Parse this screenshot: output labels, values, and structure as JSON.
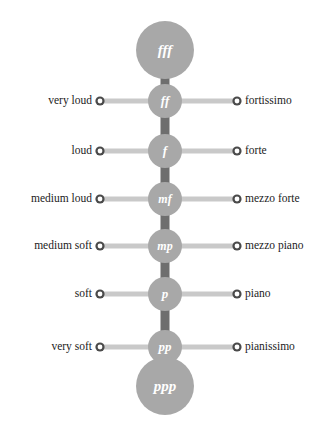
{
  "diagram": {
    "background_color": "#ffffff",
    "node_fill": "#a8a8a8",
    "connector_color": "#6e6e6e",
    "rail_color": "#c9c9c9",
    "ring_color": "#4a4a4a",
    "ring_center_color": "#ffffff",
    "glyph_color": "#ffffff"
  },
  "nodes": [
    {
      "id": "fff",
      "glyph": "fff",
      "size": "large",
      "cx": 165,
      "cy": 50,
      "r": 29,
      "font_size": 15,
      "english": "",
      "italian": ""
    },
    {
      "id": "ff",
      "glyph": "ff",
      "size": "small",
      "cx": 165,
      "cy": 101,
      "r": 17,
      "font_size": 13,
      "english": "very loud",
      "italian": "fortissimo"
    },
    {
      "id": "f",
      "glyph": "f",
      "size": "small",
      "cx": 165,
      "cy": 151,
      "r": 17,
      "font_size": 13,
      "english": "loud",
      "italian": "forte"
    },
    {
      "id": "mf",
      "glyph": "mf",
      "size": "small",
      "cx": 165,
      "cy": 199,
      "r": 17,
      "font_size": 12,
      "english": "medium loud",
      "italian": "mezzo forte"
    },
    {
      "id": "mp",
      "glyph": "mp",
      "size": "small",
      "cx": 165,
      "cy": 246,
      "r": 17,
      "font_size": 12,
      "english": "medium soft",
      "italian": "mezzo piano"
    },
    {
      "id": "p",
      "glyph": "p",
      "size": "small",
      "cx": 165,
      "cy": 294,
      "r": 17,
      "font_size": 13,
      "english": "soft",
      "italian": "piano"
    },
    {
      "id": "pp",
      "glyph": "pp",
      "size": "small",
      "cx": 165,
      "cy": 347,
      "r": 17,
      "font_size": 13,
      "english": "very soft",
      "italian": "pianissimo"
    },
    {
      "id": "ppp",
      "glyph": "ppp",
      "size": "large",
      "cx": 165,
      "cy": 386,
      "r": 29,
      "font_size": 15,
      "english": "",
      "italian": ""
    }
  ],
  "labels": {
    "left": [
      "very loud",
      "loud",
      "medium loud",
      "medium soft",
      "soft",
      "very soft"
    ],
    "right": [
      "fortissimo",
      "forte",
      "mezzo forte",
      "mezzo piano",
      "piano",
      "pianissimo"
    ]
  },
  "geometry": {
    "left_ring_x": 100,
    "right_ring_x": 237,
    "ring_r": 4.6,
    "rail_thickness": 5,
    "connector_width": 9,
    "left_label_right_edge": 92,
    "right_label_left_edge": 245
  }
}
